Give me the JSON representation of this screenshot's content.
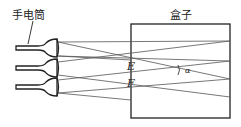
{
  "labels": {
    "flashlight": "手电筒",
    "box": "盒子",
    "point_e": "E",
    "point_f": "F",
    "angle": "α"
  },
  "colors": {
    "line": "#222222",
    "ray": "#555555"
  }
}
